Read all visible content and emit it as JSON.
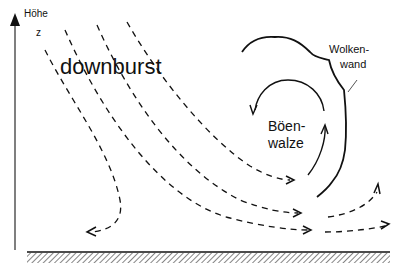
{
  "diagram": {
    "title": "downburst",
    "axis": {
      "label_line1": "Höhe",
      "label_line2": "z"
    },
    "cloud_wall": {
      "label_line1": "Wolken-",
      "label_line2": "wand"
    },
    "gust_roll": {
      "label_line1": "Böen-",
      "label_line2": "walze"
    },
    "colors": {
      "ink": "#111111",
      "background": "#ffffff"
    }
  }
}
